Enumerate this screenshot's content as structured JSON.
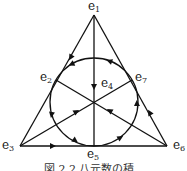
{
  "diagram": {
    "caption": "図 2.2 八元数の積",
    "nodes": [
      {
        "id": "e1",
        "base": "e",
        "index": "1"
      },
      {
        "id": "e2",
        "base": "e",
        "index": "2"
      },
      {
        "id": "e3",
        "base": "e",
        "index": "3"
      },
      {
        "id": "e4",
        "base": "e",
        "index": "4"
      },
      {
        "id": "e5",
        "base": "e",
        "index": "5"
      },
      {
        "id": "e6",
        "base": "e",
        "index": "6"
      },
      {
        "id": "e7",
        "base": "e",
        "index": "7"
      }
    ],
    "lines": [
      {
        "path": [
          "e1",
          "e2",
          "e3"
        ],
        "direction": "e1→e2→e3"
      },
      {
        "path": [
          "e1",
          "e4",
          "e5"
        ],
        "direction": "e1→e4→e5"
      },
      {
        "path": [
          "e3",
          "e5",
          "e6"
        ],
        "direction": "e3→e5→e6"
      },
      {
        "path": [
          "e6",
          "e7",
          "e1"
        ],
        "direction": "e6→e7→e1"
      },
      {
        "path": [
          "e3",
          "e4",
          "e7"
        ],
        "direction": "e3→e4→e7"
      },
      {
        "path": [
          "e6",
          "e4",
          "e2"
        ],
        "direction": "e6→e4→e2"
      },
      {
        "path": [
          "e2",
          "e5",
          "e7"
        ],
        "direction": "circle e7→e2→e5→e7 (counter-clockwise)"
      }
    ],
    "colors": {
      "stroke": "#111111",
      "text": "#222222",
      "background": "#ffffff"
    }
  }
}
